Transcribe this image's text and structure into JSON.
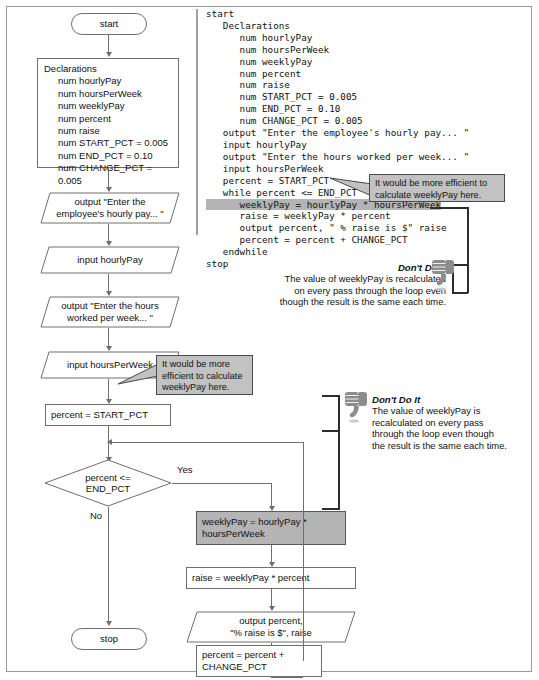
{
  "flowchart": {
    "start_label": "start",
    "stop_label": "stop",
    "declarations": {
      "header": "Declarations",
      "items": [
        "num hourlyPay",
        "num hoursPerWeek",
        "num weeklyPay",
        "num percent",
        "num raise",
        "num START_PCT = 0.005",
        "num END_PCT = 0.10",
        "num CHANGE_PCT = 0.005"
      ]
    },
    "output_prompt_pay": "output \"Enter the\nemployee's hourly pay... \"",
    "input_hourly_pay": "input hourlyPay",
    "output_prompt_hours": "output \"Enter the hours\nworked per week... \"",
    "input_hours_per_week": "input hoursPerWeek",
    "assign_percent_start": "percent = START_PCT",
    "decision": "percent <=\nEND_PCT",
    "yes_label": "Yes",
    "no_label": "No",
    "assign_weekly_pay": "weeklyPay = hourlyPay *\nhoursPerWeek",
    "assign_raise": "raise = weeklyPay * percent",
    "output_raise": "output percent,\n\"% raise is $\", raise",
    "assign_percent_increment": "percent = percent +\nCHANGE_PCT"
  },
  "code": {
    "lines": [
      "start",
      "   Declarations",
      "      num hourlyPay",
      "      num hoursPerWeek",
      "      num weeklyPay",
      "      num percent",
      "      num raise",
      "      num START_PCT = 0.005",
      "      num END_PCT = 0.10",
      "      num CHANGE_PCT = 0.005",
      "   output \"Enter the employee's hourly pay... \"",
      "   input hourlyPay",
      "   output \"Enter the hours worked per week... \"",
      "   input hoursPerWeek",
      "   percent = START_PCT",
      "   while percent <= END_PCT",
      "      weeklyPay = hourlyPay * hoursPerWeek",
      "      raise = weeklyPay * percent",
      "      output percent, \" % raise is $\" raise",
      "      percent = percent + CHANGE_PCT",
      "   endwhile",
      "stop"
    ],
    "highlighted_line": "      weeklyPay = hourlyPay * hoursPerWeek"
  },
  "callouts": {
    "code_callout": "It would be more efficient to\ncalculate weeklyPay here.",
    "chart_callout": "It would be more\nefficient to calculate\nweeklyPay here."
  },
  "dont_do_it": {
    "title": "Don't Do It",
    "code_body": "The value of weeklyPay is recalculated\non every pass through the loop even\nthough the result is the same each time.",
    "chart_body": "The value of weeklyPay is\nrecalculated on every pass\nthrough the loop even though\nthe result is the same each time.",
    "icon": "thumbs-down-icon"
  },
  "colors": {
    "highlight_gray": "#b4b4b4",
    "callout_gray": "#c2c2c2",
    "line_gray": "#6f6f6f",
    "frame_gray": "#9a9a9a"
  }
}
